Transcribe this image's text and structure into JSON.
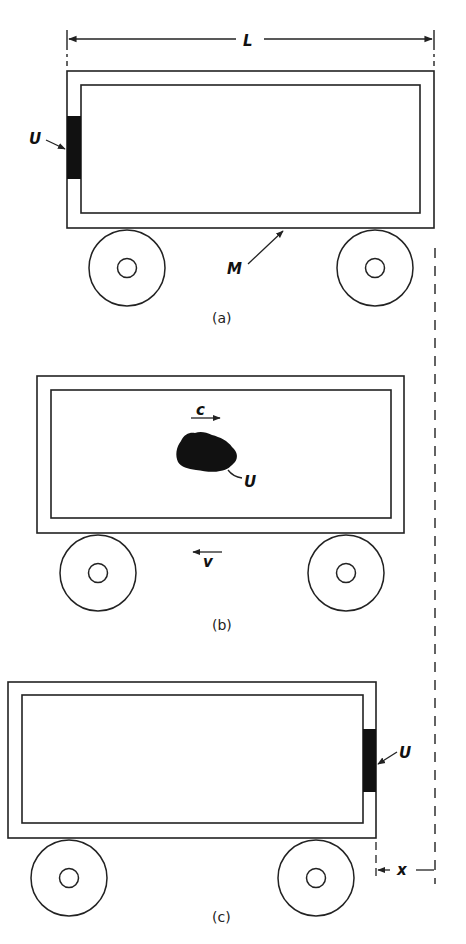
{
  "diagram": {
    "colors": {
      "ink": "#222222",
      "fill_block": "#111111",
      "background": "#ffffff"
    },
    "dimension_top": {
      "label": "L"
    },
    "panel_a": {
      "caption": "(a)",
      "block_label": "U",
      "mass_label": "M"
    },
    "panel_b": {
      "caption": "(b)",
      "blob_label": "U",
      "photon_velocity_label": "c",
      "box_velocity_label": "v"
    },
    "panel_c": {
      "caption": "(c)",
      "block_label": "U",
      "displacement_label": "x"
    }
  }
}
